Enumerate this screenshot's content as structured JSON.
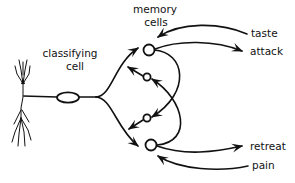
{
  "diagram": {
    "type": "neural-circuit",
    "labels": {
      "memory_cells_line1": "memory",
      "memory_cells_line2": "cells",
      "classifying_cell_line1": "classifying",
      "classifying_cell_line2": "cell",
      "taste": "taste",
      "attack": "attack",
      "retreat": "retreat",
      "pain": "pain"
    },
    "nodes": [
      {
        "id": "classifying-neuron",
        "label": "classifying cell"
      },
      {
        "id": "memory-cell-top-large"
      },
      {
        "id": "memory-cell-upper-small"
      },
      {
        "id": "memory-cell-lower-small"
      },
      {
        "id": "memory-cell-bottom-large"
      }
    ],
    "edges": [
      {
        "from": "classifying-neuron",
        "to": "memory-cell-top-large"
      },
      {
        "from": "classifying-neuron",
        "to": "memory-cell-bottom-large"
      },
      {
        "from": "memory-cell-upper-small",
        "to": "classifying-neuron"
      },
      {
        "from": "memory-cell-lower-small",
        "to": "classifying-neuron"
      },
      {
        "from": "taste",
        "to": "memory-cell-top-large"
      },
      {
        "from": "memory-cell-top-large",
        "to": "attack"
      },
      {
        "from": "memory-cell-top-large",
        "to": "memory-cell-lower-small"
      },
      {
        "from": "memory-cell-bottom-large",
        "to": "memory-cell-upper-small"
      },
      {
        "from": "memory-cell-bottom-large",
        "to": "retreat"
      },
      {
        "from": "pain",
        "to": "memory-cell-bottom-large"
      }
    ]
  }
}
